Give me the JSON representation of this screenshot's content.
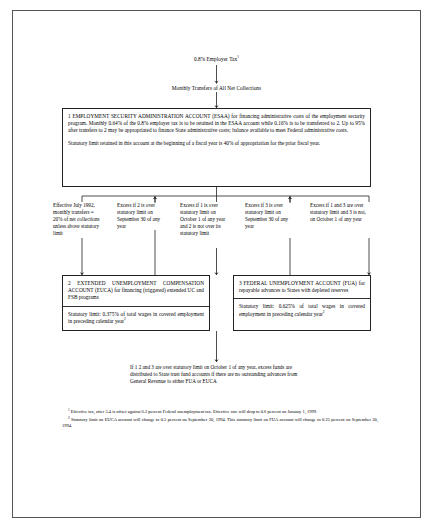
{
  "diagram": {
    "top_source": "0.8% Employer Tax",
    "top_source_footnote": "1",
    "transfer_label": "Monthly Transfers of All Net Collections",
    "esaa_box": {
      "paragraph1": "1 EMPLOYMENT SECURITY ADMINISTRATION ACCOUNT (ESAA) for financing administrative costs of the employment security program. Monthly 0.64% of the 0.8% employer tax is to be retained in the ESAA account while 0.16% is to be transferred to 2. Up to 95% after transfers to 2 may be appropriated to finance State administrative costs; balance available to meet Federal administrative costs.",
      "paragraph2": "Statutory limit retained in this account at the beginning of a fiscal year is 40% of appropriation for the prior fiscal year."
    },
    "branches": [
      {
        "id": "branch-1",
        "text": "Effective July 1992, monthly transfers = 20% of net collections unless above statutory limit"
      },
      {
        "id": "branch-2",
        "text": "Excess if 2 is over statutory limit on September 30 of any year"
      },
      {
        "id": "branch-3",
        "text": "Excess if 1 is over statutory limit on October 1 of any year and 2 is not over its statutory limit"
      },
      {
        "id": "branch-4",
        "text": "Excess if 3 is over statutory limit on September 30 of any year"
      },
      {
        "id": "branch-5",
        "text": "Excess if 1 and 3 are over statutory limit and 3 is not, on October 1 of any year"
      }
    ],
    "euca_box": {
      "paragraph1": "2 EXTENDED UNEMPLOYMENT COMPENSATION ACCOUNT (EUCA) for financing (triggered) extended UC and FSB programs",
      "paragraph2": "Statutory limit: 0.375% of total wages in covered employment in preceding calendar year",
      "paragraph2_footnote": "2"
    },
    "fua_box": {
      "paragraph1": "3 FEDERAL UNEMPLOYMENT ACCOUNT (FUA) for repayable advances to States with depleted reserves",
      "paragraph2": "Statutory limit: 0.625% of total wages in covered employment in preceding calendar year",
      "paragraph2_footnote": "2"
    },
    "bottom_note": "If 1 2 and 3 are over statutory limit on October 1 of any year, excess funds are distributed to State trust fund accounts if there are no outstanding advances from General Revenue to either FUA or EUCA",
    "footnotes": [
      {
        "mark": "1",
        "text": "Effective tax, after 5.4 is offset against 6.2 percent Federal unemployment tax. Effective rate will drop to 0.6 percent on January 1, 1999."
      },
      {
        "mark": "2",
        "text": "Statutory limit on EUCA account will change to 0.5 percent on September 30, 1994. This statutory limit on FUA account will change to 0.25 percent on September 30, 1994."
      }
    ],
    "colors": {
      "line": "#222222",
      "border": "#555555",
      "background": "#ffffff",
      "text": "#000000"
    }
  }
}
